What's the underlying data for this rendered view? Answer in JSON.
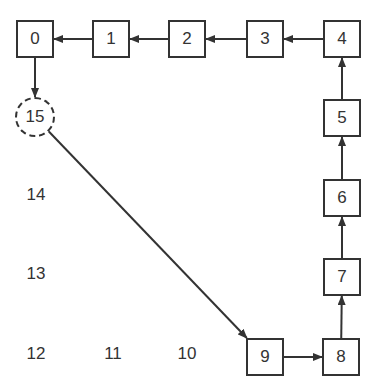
{
  "diagram": {
    "boxes": [
      {
        "id": "0",
        "label": "0",
        "x": 16,
        "y": 20,
        "w": 38,
        "h": 38
      },
      {
        "id": "1",
        "label": "1",
        "x": 92,
        "y": 20,
        "w": 38,
        "h": 38
      },
      {
        "id": "2",
        "label": "2",
        "x": 168,
        "y": 20,
        "w": 38,
        "h": 38
      },
      {
        "id": "3",
        "label": "3",
        "x": 246,
        "y": 20,
        "w": 38,
        "h": 38
      },
      {
        "id": "4",
        "label": "4",
        "x": 323,
        "y": 20,
        "w": 38,
        "h": 38
      },
      {
        "id": "5",
        "label": "5",
        "x": 323,
        "y": 99,
        "w": 38,
        "h": 38
      },
      {
        "id": "6",
        "label": "6",
        "x": 323,
        "y": 179,
        "w": 38,
        "h": 38
      },
      {
        "id": "7",
        "label": "7",
        "x": 323,
        "y": 258,
        "w": 38,
        "h": 38
      },
      {
        "id": "8",
        "label": "8",
        "x": 322,
        "y": 338,
        "w": 38,
        "h": 38
      },
      {
        "id": "9",
        "label": "9",
        "x": 246,
        "y": 338,
        "w": 38,
        "h": 38
      }
    ],
    "circle": {
      "id": "15",
      "label": "15",
      "cx": 35,
      "cy": 117,
      "r": 20,
      "style": "dashed"
    },
    "free_labels": [
      {
        "id": "14",
        "label": "14",
        "x": 36,
        "y": 195
      },
      {
        "id": "13",
        "label": "13",
        "x": 36,
        "y": 274
      },
      {
        "id": "12",
        "label": "12",
        "x": 36,
        "y": 354
      },
      {
        "id": "11",
        "label": "11",
        "x": 113,
        "y": 354
      },
      {
        "id": "10",
        "label": "10",
        "x": 187,
        "y": 354
      }
    ],
    "edges": [
      {
        "from": "1",
        "to": "0"
      },
      {
        "from": "2",
        "to": "1"
      },
      {
        "from": "3",
        "to": "2"
      },
      {
        "from": "4",
        "to": "3"
      },
      {
        "from": "5",
        "to": "4"
      },
      {
        "from": "6",
        "to": "5"
      },
      {
        "from": "7",
        "to": "6"
      },
      {
        "from": "8",
        "to": "7"
      },
      {
        "from": "9",
        "to": "8"
      },
      {
        "from": "0",
        "to": "15"
      },
      {
        "from": "15",
        "to": "9"
      }
    ],
    "stroke_color": "#333333"
  }
}
